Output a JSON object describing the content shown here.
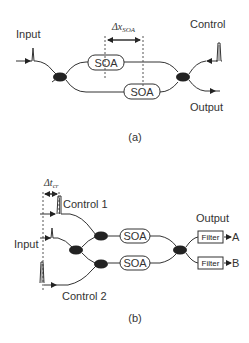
{
  "panel_a": {
    "caption": "(a)",
    "input_label": "Input",
    "control_label": "Control",
    "output_label": "Output",
    "delta_main": "Δx",
    "delta_sub": "SOA",
    "soa_upper": "SOA",
    "soa_lower": "SOA"
  },
  "panel_b": {
    "caption": "(b)",
    "delta_main": "Δt",
    "delta_sub": "cr",
    "control1_label": "Control 1",
    "control2_label": "Control 2",
    "input_label": "Input",
    "output_label": "Output",
    "soa_upper": "SOA",
    "soa_lower": "SOA",
    "filter_upper": "Filter",
    "filter_lower": "Filter",
    "port_a": "A",
    "port_b": "B"
  },
  "colors": {
    "line": "#333333",
    "coupler": "#222222",
    "background": "#ffffff"
  }
}
